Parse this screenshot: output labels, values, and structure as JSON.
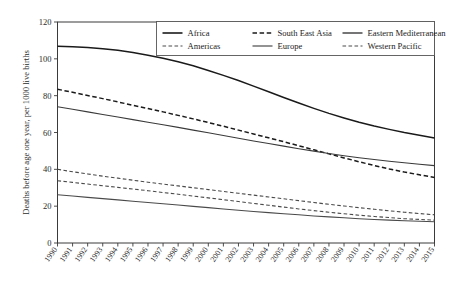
{
  "chart_data": {
    "type": "line",
    "title": "",
    "xlabel": "",
    "ylabel": "Deaths before age one year, per 1000 live births",
    "xlim": [
      1990,
      2015
    ],
    "ylim": [
      0,
      120
    ],
    "yticks": [
      0,
      20,
      40,
      60,
      80,
      100,
      120
    ],
    "ytick_labels": [
      "0",
      "20",
      "40",
      "60",
      "80",
      "100",
      "120"
    ],
    "grid": false,
    "legend_position": "top-right",
    "x": [
      1990,
      1991,
      1992,
      1993,
      1994,
      1995,
      1996,
      1997,
      1998,
      1999,
      2000,
      2001,
      2002,
      2003,
      2004,
      2005,
      2006,
      2007,
      2008,
      2009,
      2010,
      2011,
      2012,
      2013,
      2014,
      2015
    ],
    "xtick_labels": [
      "1990",
      "1991",
      "1992",
      "1993",
      "1994",
      "1995",
      "1996",
      "1997",
      "1998",
      "1999",
      "2000",
      "2001",
      "2002",
      "2003",
      "2004",
      "2005",
      "2006",
      "2007",
      "2008",
      "2009",
      "2010",
      "2011",
      "2012",
      "2013",
      "2014",
      "2015"
    ],
    "series": [
      {
        "name": "Africa",
        "style": "solid",
        "color": "#1a1a1a",
        "width": 1.5,
        "values": [
          106.8,
          106.6,
          106.2,
          105.5,
          104.6,
          103.4,
          102.0,
          100.3,
          98.4,
          96.2,
          93.7,
          91.0,
          88.2,
          85.2,
          82.1,
          79.0,
          76.0,
          73.1,
          70.4,
          67.9,
          65.6,
          63.5,
          61.7,
          60.0,
          58.5,
          57.0
        ]
      },
      {
        "name": "South East Asia",
        "style": "dashed",
        "color": "#1a1a1a",
        "width": 1.5,
        "values": [
          83.5,
          81.8,
          80.1,
          78.4,
          76.6,
          74.8,
          73.0,
          71.2,
          69.3,
          67.4,
          65.4,
          63.4,
          61.3,
          59.2,
          57.1,
          55.0,
          52.8,
          50.6,
          48.4,
          46.2,
          44.1,
          42.1,
          40.2,
          38.5,
          37.0,
          35.6
        ]
      },
      {
        "name": "Eastern Mediterranean",
        "style": "solid",
        "color": "#3a3a3a",
        "width": 1.1,
        "values": [
          74.0,
          72.6,
          71.2,
          69.8,
          68.4,
          67.0,
          65.6,
          64.2,
          62.8,
          61.3,
          59.9,
          58.4,
          56.9,
          55.4,
          54.0,
          52.6,
          51.2,
          49.9,
          48.6,
          47.4,
          46.3,
          45.3,
          44.4,
          43.6,
          42.8,
          42.0
        ]
      },
      {
        "name": "Americas",
        "style": "dashed",
        "color": "#4a4a4a",
        "width": 1.1,
        "values": [
          40.0,
          38.7,
          37.5,
          36.3,
          35.2,
          34.1,
          33.0,
          32.0,
          31.0,
          30.0,
          29.0,
          28.0,
          27.0,
          26.0,
          25.0,
          24.0,
          23.0,
          22.0,
          21.0,
          20.1,
          19.2,
          18.3,
          17.5,
          16.7,
          16.0,
          15.3
        ]
      },
      {
        "name": "Western Pacific",
        "style": "dashed",
        "color": "#4a4a4a",
        "width": 1.1,
        "values": [
          33.8,
          32.9,
          32.0,
          31.1,
          30.2,
          29.3,
          28.4,
          27.4,
          26.5,
          25.5,
          24.5,
          23.5,
          22.5,
          21.5,
          20.5,
          19.5,
          18.5,
          17.6,
          16.7,
          15.9,
          15.1,
          14.4,
          13.8,
          13.2,
          12.8,
          12.4
        ]
      },
      {
        "name": "Europe",
        "style": "solid",
        "color": "#4a4a4a",
        "width": 1.1,
        "values": [
          26.2,
          25.5,
          24.8,
          24.1,
          23.4,
          22.7,
          22.0,
          21.3,
          20.6,
          19.9,
          19.2,
          18.5,
          17.8,
          17.1,
          16.5,
          15.9,
          15.3,
          14.7,
          14.2,
          13.7,
          13.2,
          12.8,
          12.4,
          12.1,
          11.8,
          11.5
        ]
      }
    ],
    "legend": [
      {
        "label": "Africa",
        "style": "solid",
        "color": "#1a1a1a",
        "width": 1.6
      },
      {
        "label": "South East Asia",
        "style": "dashed",
        "color": "#1a1a1a",
        "width": 1.6
      },
      {
        "label": "Eastern Mediterranean",
        "style": "solid",
        "color": "#3a3a3a",
        "width": 1.4
      },
      {
        "label": "Americas",
        "style": "dashed",
        "color": "#4a4a4a",
        "width": 1.2
      },
      {
        "label": "Europe",
        "style": "solid",
        "color": "#4a4a4a",
        "width": 1.2
      },
      {
        "label": "Western Pacific",
        "style": "dashed",
        "color": "#4a4a4a",
        "width": 1.2
      }
    ]
  }
}
